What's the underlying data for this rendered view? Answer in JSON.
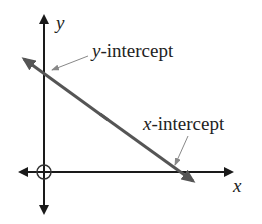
{
  "diagram": {
    "type": "coordinate-axes-with-line",
    "axes": {
      "x_label": "x",
      "y_label": "y",
      "origin_marker": "circle"
    },
    "line": {
      "description": "line with negative slope crossing both axes",
      "color": "#555555"
    },
    "annotations": [
      {
        "var": "y",
        "text": "-intercept",
        "points_to": "y-axis crossing"
      },
      {
        "var": "x",
        "text": "-intercept",
        "points_to": "x-axis crossing"
      }
    ],
    "colors": {
      "axes": "#222222",
      "line": "#555555",
      "pointer": "#888888"
    }
  }
}
